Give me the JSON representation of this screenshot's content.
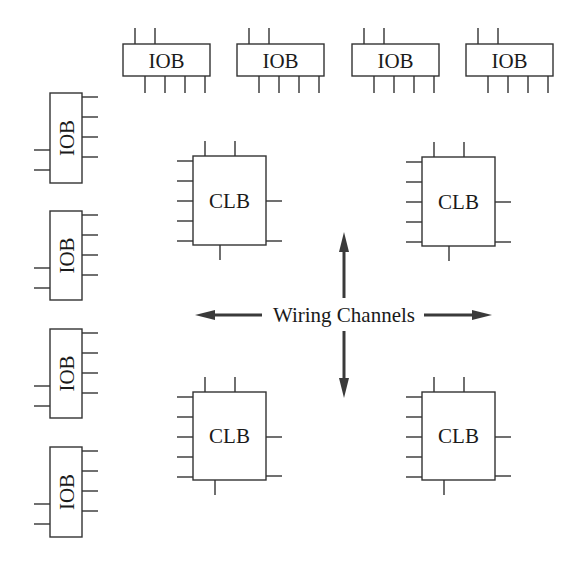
{
  "diagram": {
    "colors": {
      "stroke": "#333333",
      "arrow": "#3a3a3a",
      "background": "#ffffff"
    },
    "top_iobs": [
      {
        "label": "IOB",
        "x": 123,
        "y": 44,
        "w": 87,
        "h": 32
      },
      {
        "label": "IOB",
        "x": 237,
        "y": 44,
        "w": 87,
        "h": 32
      },
      {
        "label": "IOB",
        "x": 352,
        "y": 44,
        "w": 87,
        "h": 32
      },
      {
        "label": "IOB",
        "x": 466,
        "y": 44,
        "w": 87,
        "h": 32
      }
    ],
    "left_iobs": [
      {
        "label": "IOB",
        "x": 50,
        "y": 93,
        "w": 32,
        "h": 90
      },
      {
        "label": "IOB",
        "x": 50,
        "y": 211,
        "w": 32,
        "h": 89
      },
      {
        "label": "IOB",
        "x": 50,
        "y": 329,
        "w": 32,
        "h": 89
      },
      {
        "label": "IOB",
        "x": 50,
        "y": 447,
        "w": 32,
        "h": 90
      }
    ],
    "clbs": [
      {
        "label": "CLB",
        "x": 193,
        "y": 156,
        "w": 73,
        "h": 89
      },
      {
        "label": "CLB",
        "x": 422,
        "y": 157,
        "w": 73,
        "h": 89
      },
      {
        "label": "CLB",
        "x": 193,
        "y": 392,
        "w": 73,
        "h": 88
      },
      {
        "label": "CLB",
        "x": 422,
        "y": 392,
        "w": 73,
        "h": 88
      }
    ],
    "wiring": {
      "label": "Wiring Channels",
      "center_x": 344,
      "center_y": 315,
      "arrows": [
        "up",
        "down",
        "left",
        "right"
      ]
    }
  }
}
